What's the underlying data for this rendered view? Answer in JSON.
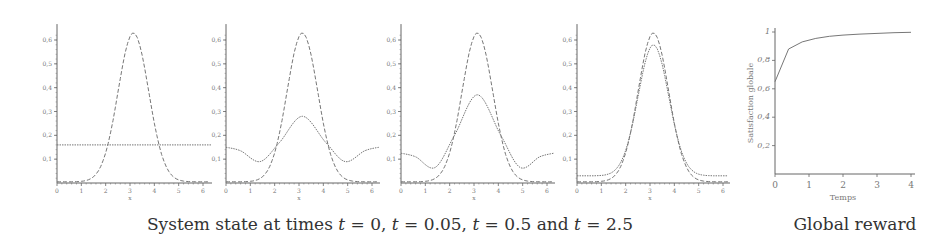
{
  "chart_data": [
    {
      "type": "line",
      "title": "t = 0",
      "xlabel": "x",
      "ylabel": "",
      "xlim": [
        0,
        6.28
      ],
      "ylim": [
        0,
        0.65
      ],
      "x_ticks": [
        "0",
        "1",
        "2",
        "3",
        "4",
        "5",
        "6"
      ],
      "y_ticks": [
        "0,1",
        "0,2",
        "0,3",
        "0,4",
        "0,5",
        "0,6"
      ],
      "grid": false,
      "series": [
        {
          "name": "target",
          "style": "dashed",
          "peak_x": 3.14,
          "peak_y": 0.63,
          "sigma": 0.63,
          "baseline": 0.005
        },
        {
          "name": "state",
          "style": "dotted",
          "values": "flat",
          "y": 0.16
        }
      ]
    },
    {
      "type": "line",
      "title": "t = 0.05",
      "xlabel": "x",
      "xlim": [
        0,
        6.28
      ],
      "ylim": [
        0,
        0.65
      ],
      "x_ticks": [
        "0",
        "1",
        "2",
        "3",
        "4",
        "5",
        "6"
      ],
      "y_ticks": [
        "0,1",
        "0,2",
        "0,3",
        "0,4",
        "0,5",
        "0,6"
      ],
      "grid": false,
      "series": [
        {
          "name": "target",
          "style": "dashed",
          "peak_x": 3.14,
          "peak_y": 0.63,
          "sigma": 0.63,
          "baseline": 0.005
        },
        {
          "name": "state",
          "style": "dotted",
          "points": [
            [
              0,
              0.15
            ],
            [
              0.6,
              0.135
            ],
            [
              1.4,
              0.09
            ],
            [
              2.2,
              0.17
            ],
            [
              3.14,
              0.28
            ],
            [
              4.1,
              0.17
            ],
            [
              4.9,
              0.09
            ],
            [
              5.7,
              0.135
            ],
            [
              6.28,
              0.15
            ]
          ]
        }
      ]
    },
    {
      "type": "line",
      "title": "t = 0.5",
      "xlabel": "x",
      "xlim": [
        0,
        6.28
      ],
      "ylim": [
        0,
        0.65
      ],
      "x_ticks": [
        "0",
        "1",
        "2",
        "3",
        "4",
        "5",
        "6"
      ],
      "y_ticks": [
        "0,1",
        "0,2",
        "0,3",
        "0,4",
        "0,5",
        "0,6"
      ],
      "grid": false,
      "series": [
        {
          "name": "target",
          "style": "dashed",
          "peak_x": 3.14,
          "peak_y": 0.63,
          "sigma": 0.63,
          "baseline": 0.005
        },
        {
          "name": "state",
          "style": "dotted",
          "points": [
            [
              0,
              0.125
            ],
            [
              0.6,
              0.11
            ],
            [
              1.4,
              0.065
            ],
            [
              2.2,
              0.2
            ],
            [
              3.14,
              0.37
            ],
            [
              4.1,
              0.2
            ],
            [
              4.9,
              0.065
            ],
            [
              5.7,
              0.11
            ],
            [
              6.28,
              0.125
            ]
          ]
        }
      ]
    },
    {
      "type": "line",
      "title": "t = 2.5",
      "xlabel": "x",
      "xlim": [
        0,
        6.28
      ],
      "ylim": [
        0,
        0.65
      ],
      "x_ticks": [
        "0",
        "1",
        "2",
        "3",
        "4",
        "5",
        "6"
      ],
      "y_ticks": [
        "0,1",
        "0,2",
        "0,3",
        "0,4",
        "0,5",
        "0,6"
      ],
      "grid": false,
      "series": [
        {
          "name": "target",
          "style": "dashed",
          "peak_x": 3.14,
          "peak_y": 0.63,
          "sigma": 0.63,
          "baseline": 0.005
        },
        {
          "name": "state",
          "style": "dotted",
          "peak_x": 3.14,
          "peak_y": 0.58,
          "sigma": 0.63,
          "baseline": 0.03
        }
      ]
    },
    {
      "type": "line",
      "title": "Global reward",
      "xlabel": "Temps",
      "ylabel": "Satisfaction globale",
      "xlim": [
        0,
        4
      ],
      "ylim": [
        0,
        1
      ],
      "x_ticks": [
        "0",
        "1",
        "2",
        "3",
        "4"
      ],
      "y_ticks": [
        "0,2",
        "0,4",
        "0,6",
        "0,8",
        "1"
      ],
      "grid": false,
      "series": [
        {
          "name": "satisfaction",
          "style": "solid",
          "points": [
            [
              0,
              0.65
            ],
            [
              0.4,
              0.88
            ],
            [
              0.8,
              0.93
            ],
            [
              1.2,
              0.955
            ],
            [
              1.6,
              0.97
            ],
            [
              2,
              0.978
            ],
            [
              2.5,
              0.985
            ],
            [
              3,
              0.99
            ],
            [
              3.5,
              0.995
            ],
            [
              4,
              0.998
            ]
          ]
        }
      ]
    }
  ],
  "captions": {
    "left": "System state at times t = 0, t = 0.05, t = 0.5 and t = 2.5",
    "left_parts": [
      "System state at times ",
      "t",
      " = 0, ",
      "t",
      " = 0.05, ",
      "t",
      " = 0.5 and ",
      "t",
      " = 2.5"
    ],
    "right": "Global reward"
  },
  "layout": {
    "panels": [
      {
        "x0": 57,
        "x1": 203,
        "y0": 183,
        "ytop": 40,
        "ytop_val": 0.6,
        "right_edge": 212
      },
      {
        "x0": 226,
        "x1": 372,
        "y0": 183,
        "ytop": 40,
        "ytop_val": 0.6,
        "right_edge": 380
      },
      {
        "x0": 401,
        "x1": 547,
        "y0": 183,
        "ytop": 40,
        "ytop_val": 0.6,
        "right_edge": 555
      },
      {
        "x0": 577,
        "x1": 723,
        "y0": 183,
        "ytop": 40,
        "ytop_val": 0.6,
        "right_edge": 730
      },
      {
        "x0": 775,
        "x1": 911,
        "y0": 174,
        "ytop": 32,
        "ytop_val": 1.0,
        "right_edge": 915
      }
    ],
    "colors": {
      "axis": "#666666",
      "line": "#777777",
      "text": "#333333"
    }
  }
}
